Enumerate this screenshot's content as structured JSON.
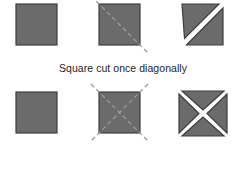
{
  "diagram": {
    "title_visible": false,
    "background_color": "#ffffff",
    "shape_fill": "#6b6b6b",
    "shape_stroke": "#3d3d3d",
    "cut_line_color": "#9a9a9a",
    "gap_color": "#ffffff",
    "text_color": "#1d1d1d",
    "rows": [
      {
        "id": "square-cut-once-diagonally",
        "caption": "Square cut once diagonally",
        "number_of_cuts": 1,
        "resulting_pieces": 2,
        "piece_shape": "triangle",
        "figures": [
          {
            "id": "whole-square",
            "label": "whole square",
            "state": "uncut"
          },
          {
            "id": "square-with-cut-line",
            "label": "square with one diagonal cut line",
            "state": "marked",
            "cut_lines": 1
          },
          {
            "id": "separated-triangles",
            "label": "two separated triangles",
            "state": "cut",
            "pieces": 2
          }
        ]
      },
      {
        "id": "square-cut-twice-diagonally",
        "caption": "Square cut twice diagonally",
        "number_of_cuts": 2,
        "resulting_pieces": 4,
        "piece_shape": "triangle",
        "figures": [
          {
            "id": "whole-square",
            "label": "whole square",
            "state": "uncut"
          },
          {
            "id": "square-with-cut-lines",
            "label": "square with two diagonal cut lines",
            "state": "marked",
            "cut_lines": 2
          },
          {
            "id": "separated-triangles",
            "label": "four separated triangles",
            "state": "cut",
            "pieces": 4
          }
        ]
      }
    ]
  }
}
